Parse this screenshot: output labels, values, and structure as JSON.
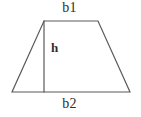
{
  "figure": {
    "canvas": {
      "width": 141,
      "height": 117
    },
    "background_color": "#ffffff",
    "stroke_color": "#5a5a5a",
    "text_color": "#2e2e2e",
    "labels": {
      "top_base": "b1",
      "bottom_base": "b2",
      "height": "h"
    },
    "shape": {
      "type": "trapezoid",
      "vertices": {
        "top_left": [
          44,
          21
        ],
        "top_right": [
          98,
          21
        ],
        "bottom_right": [
          130,
          92
        ],
        "bottom_left": [
          12,
          92
        ]
      },
      "height_segment": {
        "from": [
          44,
          21
        ],
        "to": [
          44,
          92
        ]
      }
    }
  }
}
